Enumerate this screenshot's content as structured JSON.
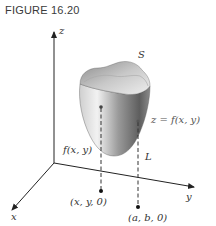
{
  "figure": {
    "title": "FIGURE 16.20"
  },
  "axes": {
    "x_label": "x",
    "y_label": "y",
    "z_label": "z"
  },
  "surface": {
    "name_label": "S",
    "equation_label": "z = f(x, y)"
  },
  "annotations": {
    "height_label": "f(x, y)",
    "line_label": "L",
    "point_xy": "(x, y, 0)",
    "point_ab": "(a, b, 0)"
  },
  "colors": {
    "axis": "#222222",
    "surface_light": "#e6e6e6",
    "surface_dark": "#6e6e6e",
    "text": "#333333"
  }
}
